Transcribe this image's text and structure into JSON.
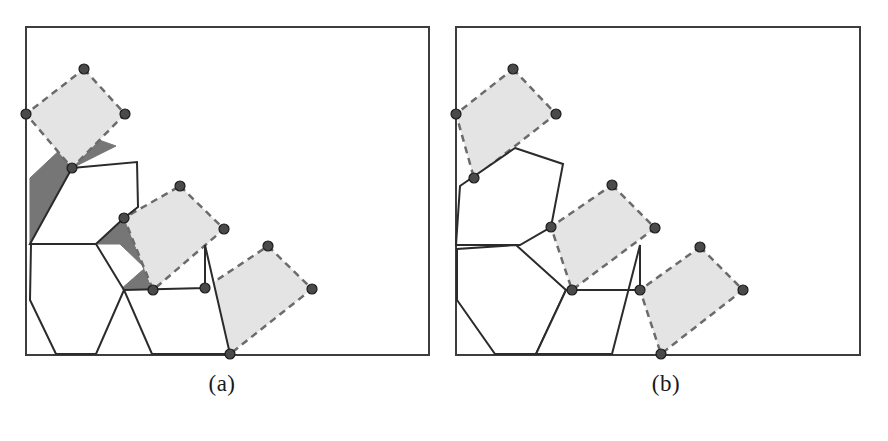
{
  "figure": {
    "background_color": "#ffffff",
    "width": 888,
    "height": 441
  },
  "style": {
    "frame_stroke": "#3d3d3d",
    "frame_stroke_width": 2,
    "polygon_stroke": "#2b2b2b",
    "polygon_fill": "#ffffff",
    "polygon_stroke_width": 2,
    "rect_fill": "#e4e4e4",
    "rect_stroke": "#6b6b6b",
    "rect_stroke_width": 2.5,
    "rect_dash": "7,5",
    "overlap_fill": "#767676",
    "vertex_fill": "#4a4a4a",
    "vertex_stroke": "#1c1c1c",
    "vertex_radius": 5
  },
  "panels": [
    {
      "id": "a",
      "caption": "(a)",
      "frame": {
        "x": 26,
        "y": 27,
        "width": 403,
        "height": 328
      },
      "overlaps": [
        {
          "name": "overlap-top-left",
          "points": "26,114 64,146 30,178 30,244 54,244 94,204 72,168 116,146"
        },
        {
          "name": "overlap-middle",
          "points": "96,244 120,244 145,268 120,290 152,290 124,218"
        },
        {
          "name": "overlap-bottom-right",
          "points": "205,288 230,354 152,354 175,330"
        }
      ],
      "rectangles": [
        {
          "name": "rect-top-left",
          "points": "84,69 125,114 72,168 26,114",
          "vertices": [
            [
              84,
              69
            ],
            [
              125,
              114
            ],
            [
              72,
              168
            ],
            [
              26,
              114
            ]
          ]
        },
        {
          "name": "rect-middle",
          "points": "180,186 224,229 153,290 124,218",
          "vertices": [
            [
              180,
              186
            ],
            [
              224,
              229
            ],
            [
              153,
              290
            ],
            [
              124,
              218
            ]
          ]
        },
        {
          "name": "rect-bottom-right",
          "points": "268,246 312,289 230,354 205,288",
          "vertices": [
            [
              268,
              246
            ],
            [
              312,
              289
            ],
            [
              230,
              354
            ],
            [
              205,
              288
            ]
          ]
        }
      ],
      "polygons": [
        {
          "name": "polygon-pentagon-upper",
          "points": "72,168 137,162 138,207 124,218 96,244 30,244"
        },
        {
          "name": "polygon-hexagon",
          "points": "31,244 96,244 124,290 96,354 56,354 30,300"
        },
        {
          "name": "polygon-quad-lower",
          "points": "124,290 205,288 205,245 230,354 152,354"
        }
      ],
      "vertex_count": 12
    },
    {
      "id": "b",
      "caption": "(b)",
      "frame": {
        "x": 456,
        "y": 27,
        "width": 404,
        "height": 328
      },
      "overlaps": [],
      "rectangles": [
        {
          "name": "rect-top-left",
          "points": "513,69 556,114 474,178 456,114",
          "vertices": [
            [
              513,
              69
            ],
            [
              556,
              114
            ],
            [
              474,
              178
            ],
            [
              456,
              114
            ]
          ]
        },
        {
          "name": "rect-middle",
          "points": "612,185 655,228 572,290 551,227",
          "vertices": [
            [
              612,
              185
            ],
            [
              655,
              228
            ],
            [
              572,
              290
            ],
            [
              551,
              227
            ]
          ]
        },
        {
          "name": "rect-bottom-right",
          "points": "700,247 743,290 661,354 640,290",
          "vertices": [
            [
              700,
              247
            ],
            [
              743,
              290
            ],
            [
              661,
              354
            ],
            [
              640,
              290
            ]
          ]
        }
      ],
      "polygons": [
        {
          "name": "polygon-pentagon-upper",
          "points": "515,148 563,164 551,227 520,245 456,245 460,186"
        },
        {
          "name": "polygon-hexagon",
          "points": "516,245 566,290 536,354 495,354 457,300 457,249"
        },
        {
          "name": "polygon-quad-lower",
          "points": "566,290 640,290 640,245 612,354 536,354"
        }
      ],
      "vertex_count": 12
    }
  ]
}
